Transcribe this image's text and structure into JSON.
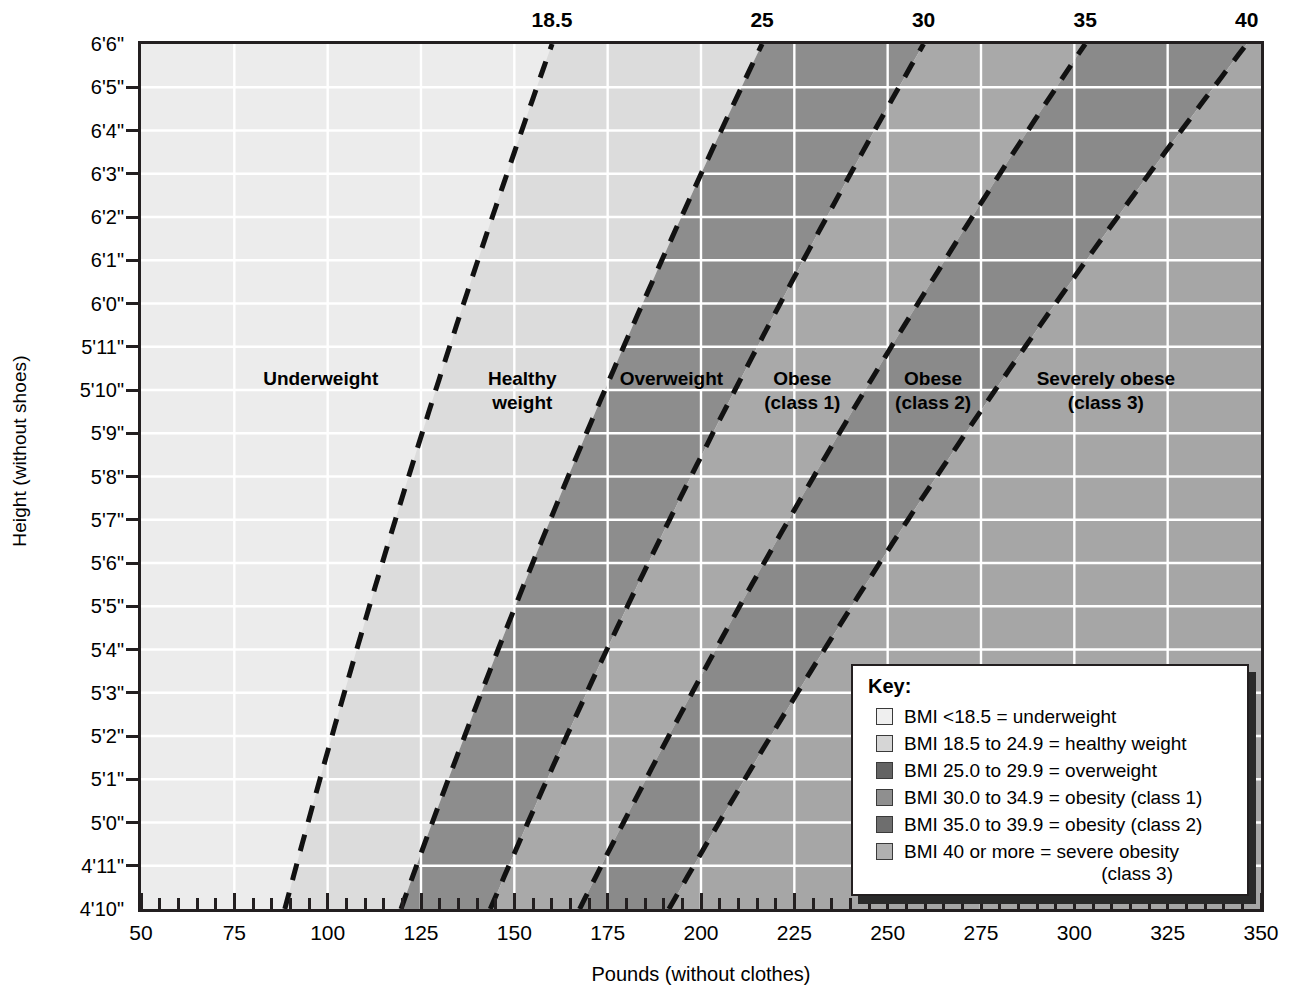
{
  "chart_data": {
    "type": "area",
    "xlabel": "Pounds (without clothes)",
    "ylabel": "Height (without shoes)",
    "xlim": [
      50,
      350
    ],
    "ylim_inches": [
      58,
      78
    ],
    "x_major_ticks": [
      50,
      75,
      100,
      125,
      150,
      175,
      200,
      225,
      250,
      275,
      300,
      325,
      350
    ],
    "x_minor_step": 5,
    "y_tick_labels": [
      "4'10\"",
      "4'11\"",
      "5'0\"",
      "5'1\"",
      "5'2\"",
      "5'3\"",
      "5'4\"",
      "5'5\"",
      "5'6\"",
      "5'7\"",
      "5'8\"",
      "5'9\"",
      "5'10\"",
      "5'11\"",
      "6'0\"",
      "6'1\"",
      "6'2\"",
      "6'3\"",
      "6'4\"",
      "6'5\"",
      "6'6\""
    ],
    "y_tick_inches": [
      58,
      59,
      60,
      61,
      62,
      63,
      64,
      65,
      66,
      67,
      68,
      69,
      70,
      71,
      72,
      73,
      74,
      75,
      76,
      77,
      78
    ],
    "top_axis_label": "BMI",
    "bmi_boundaries": [
      18.5,
      25,
      30,
      35,
      40
    ],
    "bmi_top_tick_labels": [
      "18.5",
      "25",
      "30",
      "35",
      "40"
    ],
    "grid": true,
    "grid_color": "#ffffff",
    "bands": [
      {
        "name": "Underweight",
        "bmi_min": 0,
        "bmi_max": 18.5,
        "color": "#ececec"
      },
      {
        "name": "Healthy weight",
        "bmi_min": 18.5,
        "bmi_max": 25,
        "color": "#dcdcdc"
      },
      {
        "name": "Overweight",
        "bmi_min": 25,
        "bmi_max": 30,
        "color": "#8d8d8d"
      },
      {
        "name": "Obese (class 1)",
        "bmi_min": 30,
        "bmi_max": 35,
        "color": "#a9a9a9"
      },
      {
        "name": "Obese (class 2)",
        "bmi_min": 35,
        "bmi_max": 40,
        "color": "#8a8a8a"
      },
      {
        "name": "Severely obese (class 3)",
        "bmi_min": 40,
        "bmi_max": 99,
        "color": "#a6a6a6"
      }
    ],
    "zone_labels": [
      {
        "text": "Underweight",
        "bmi_center": 14.0,
        "line2": ""
      },
      {
        "text": "Healthy",
        "bmi_center": 21.7,
        "line2": "weight"
      },
      {
        "text": "Overweight",
        "bmi_center": 27.4,
        "line2": ""
      },
      {
        "text": "Obese",
        "bmi_center": 32.4,
        "line2": "(class 1)"
      },
      {
        "text": "Obese",
        "bmi_center": 37.4,
        "line2": "(class 2)"
      },
      {
        "text": "Severely obese",
        "bmi_center": 44.0,
        "line2": "(class 3)"
      }
    ],
    "boundary_line_style": "dashed",
    "boundary_line_color": "#111111"
  },
  "axes": {
    "y_title": "Height (without shoes)",
    "x_title": "Pounds (without clothes)"
  },
  "key": {
    "title": "Key:",
    "entries": [
      {
        "label": "BMI <18.5 = underweight",
        "swatch": "#efefef"
      },
      {
        "label": "BMI 18.5 to 24.9 = healthy weight",
        "swatch": "#d6d6d6"
      },
      {
        "label": "BMI 25.0 to 29.9 = overweight",
        "swatch": "#636363"
      },
      {
        "label": "BMI 30.0 to 34.9 = obesity (class 1)",
        "swatch": "#8f8f8f"
      },
      {
        "label": "BMI 35.0 to 39.9 = obesity (class 2)",
        "swatch": "#6e6e6e"
      },
      {
        "label": "BMI 40 or more = severe obesity",
        "swatch": "#b0b0b0"
      }
    ],
    "continuation": "(class 3)"
  }
}
